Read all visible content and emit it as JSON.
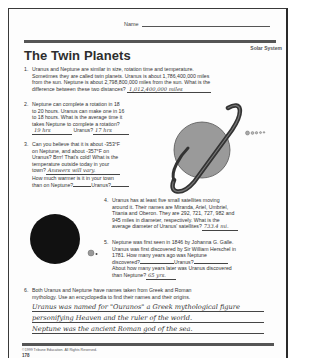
{
  "header": {
    "name_label": "Name",
    "subject": "Solar System",
    "title": "The Twin Planets"
  },
  "questions": [
    {
      "number": "1.",
      "lines": [
        "Uranus and Neptune are similar in size, rotation time and temperature.",
        "Sometimes they are called twin planets. Uranus is about 1,786,400,000 miles",
        "from the sun. Neptune is about 2,798,800,000 miles from the sun. What is the",
        "difference between these two distances?"
      ],
      "answer": "1,012,400,000 miles"
    },
    {
      "number": "2.",
      "lines": [
        "Neptune can complete a rotation in 18",
        "to 20 hours. Uranus can make one in 16",
        "to 18 hours. What is the average time it",
        "takes Neptune to complete a rotation?"
      ],
      "answer_neptune": "19 hrs",
      "uranus_label": "Uranus?",
      "answer_uranus": "17 hrs"
    },
    {
      "number": "3.",
      "lines": [
        "Can you believe that it is about -353°F",
        "on Neptune, and about -357°F on",
        "Uranus? Brrr! That's cold! What is the",
        "temperature outside today in your"
      ],
      "town_label": "town?",
      "answer_town": "Answers will vary.",
      "line_warmer": "How much warmer is it in your town",
      "neptune_label": "than on Neptune?",
      "uranus_label": "Uranus?"
    },
    {
      "number": "4.",
      "lines": [
        "Uranus has at least five small satellites moving",
        "around it. Their names are Miranda, Ariel, Umbriel,",
        "Titania and Oberon. They are 292, 721, 727, 982 and",
        "945 miles in diameter, respectively. What is the"
      ],
      "last_line": "average diameter of Uranus' satellites?",
      "answer": "733.4 mi."
    },
    {
      "number": "5.",
      "lines": [
        "Neptune was first seen in 1846 by Johanna G. Galle.",
        "Uranus was first discovered by Sir William Herschel in",
        "1781. How many years ago was Neptune"
      ],
      "discovered_label": "discovered?",
      "uranus_label": "Uranus?",
      "line_later": "About how many years later was Uranus discovered",
      "than_label": "than Neptune?",
      "answer": "65 yrs."
    },
    {
      "number": "6.",
      "lines": [
        "Both Uranus and Neptune have names taken from Greek and Roman",
        "mythology. Use an encyclopedia to find their names and their origins."
      ],
      "answer_lines": [
        "Uranus was named for \"Ouranos\" a Greek mythological figure",
        "personifying Heaven and the ruler of the world.",
        "Neptune was the ancient Roman god of the sea."
      ]
    }
  ],
  "illustrations": {
    "uranus_alt": "ringed planet illustration",
    "neptune_alt": "dark planet illustration",
    "colors": {
      "uranus_fill": "#9a9a9a",
      "ring": "#3a3a3a",
      "neptune_fill": "#111111"
    }
  },
  "footer": {
    "copyright": "©1999 Tribune Education. All Rights Reserved.",
    "page_number": "178"
  }
}
